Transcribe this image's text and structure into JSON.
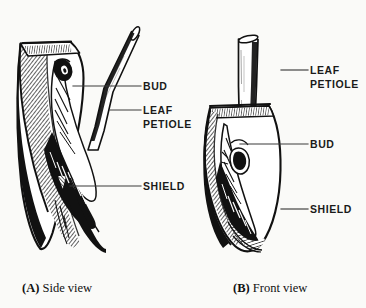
{
  "figure": {
    "background_color": "#fafaf8",
    "ink_color": "#111111",
    "leader_color": "#3a3a3a"
  },
  "panels": [
    {
      "id": "side-view",
      "caption_tag": "(A)",
      "caption_text": "Side view",
      "labels": [
        {
          "id": "bud",
          "text": "BUD"
        },
        {
          "id": "leaf-petiole-line1",
          "text": "LEAF"
        },
        {
          "id": "leaf-petiole-line2",
          "text": "PETIOLE"
        },
        {
          "id": "shield",
          "text": "SHIELD"
        }
      ]
    },
    {
      "id": "front-view",
      "caption_tag": "(B)",
      "caption_text": "Front view",
      "labels": [
        {
          "id": "leaf-petiole-line1",
          "text": "LEAF"
        },
        {
          "id": "leaf-petiole-line2",
          "text": "PETIOLE"
        },
        {
          "id": "bud",
          "text": "BUD"
        },
        {
          "id": "shield",
          "text": "SHIELD"
        }
      ]
    }
  ],
  "callouts": {
    "left_bud": "BUD",
    "left_leaf": "LEAF",
    "left_petiole": "PETIOLE",
    "left_shield": "SHIELD",
    "right_leaf": "LEAF",
    "right_petiole": "PETIOLE",
    "right_bud": "BUD",
    "right_shield": "SHIELD"
  },
  "captions": {
    "left_tag": "(A)",
    "left_text": "Side view",
    "right_tag": "(B)",
    "right_text": "Front view"
  }
}
